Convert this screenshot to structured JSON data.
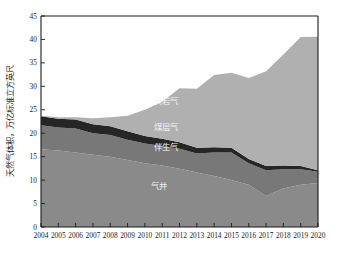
{
  "chart_data": {
    "type": "area",
    "stacked": true,
    "title": "",
    "xlabel": "",
    "ylabel": "天然气体积，万亿标准立方英尺",
    "x": [
      2004,
      2005,
      2006,
      2007,
      2008,
      2009,
      2010,
      2011,
      2012,
      2013,
      2014,
      2015,
      2016,
      2017,
      2018,
      2019,
      2020
    ],
    "categories": [
      "2004",
      "2005",
      "2006",
      "2007",
      "2008",
      "2009",
      "2010",
      "2011",
      "2012",
      "2013",
      "2014",
      "2015",
      "2016",
      "2017",
      "2018",
      "2019",
      "2020"
    ],
    "xlim": [
      2004,
      2020
    ],
    "ylim": [
      0,
      45
    ],
    "yticks": [
      0,
      5,
      10,
      15,
      20,
      25,
      30,
      35,
      40,
      45
    ],
    "ytick_labels": [
      "0",
      "5",
      "10",
      "15",
      "20",
      "25",
      "30",
      "35",
      "40",
      "45"
    ],
    "grid": false,
    "legend_position": "inline-labels",
    "series": [
      {
        "name": "气井",
        "label": "气井",
        "color": "#8a8a8a",
        "values": [
          16.6,
          16.3,
          15.9,
          15.4,
          15.0,
          14.3,
          13.6,
          13.1,
          12.4,
          11.6,
          10.9,
          10.0,
          9.0,
          6.6,
          8.2,
          9.0,
          9.4
        ]
      },
      {
        "name": "伴生气",
        "label": "伴生气",
        "color": "#787878",
        "values": [
          5.1,
          4.9,
          5.1,
          4.6,
          4.6,
          4.3,
          4.2,
          4.2,
          4.3,
          4.1,
          5.0,
          5.9,
          4.6,
          5.5,
          4.1,
          3.3,
          2.4
        ]
      },
      {
        "name": "煤层气",
        "label": "煤层气",
        "color": "#262626",
        "values": [
          1.9,
          1.9,
          1.9,
          1.9,
          1.9,
          1.8,
          1.6,
          1.5,
          1.4,
          1.2,
          1.1,
          1.0,
          0.9,
          0.9,
          0.8,
          0.7,
          0.3
        ]
      },
      {
        "name": "页岩气",
        "label": "页岩气",
        "color": "#b0b0b0",
        "values": [
          0.1,
          0.3,
          0.5,
          1.3,
          1.9,
          3.3,
          5.6,
          7.9,
          11.5,
          12.6,
          15.4,
          16.0,
          17.3,
          20.2,
          23.7,
          27.5,
          28.5
        ]
      }
    ],
    "series_totals": [
      23.7,
      23.4,
      23.4,
      23.2,
      23.4,
      23.7,
      25.0,
      26.7,
      29.6,
      29.5,
      32.4,
      32.9,
      31.8,
      33.2,
      36.8,
      40.5,
      40.6
    ],
    "colors": {
      "shale_gas": "#b0b0b0",
      "coalbed_methane": "#262626",
      "associated_gas": "#787878",
      "gas_wells": "#8a8a8a",
      "axis": "#1a1a1a",
      "background": "#ffffff",
      "label_text": "#f0f0f0"
    },
    "label_positions": {
      "shale_gas": {
        "x": 2011.2,
        "y": 26.2
      },
      "coalbed_methane": {
        "x": 2011.2,
        "y": 20.6
      },
      "associated_gas": {
        "x": 2011.2,
        "y": 16.5
      },
      "gas_wells": {
        "x": 2010.8,
        "y": 8.2
      }
    }
  }
}
